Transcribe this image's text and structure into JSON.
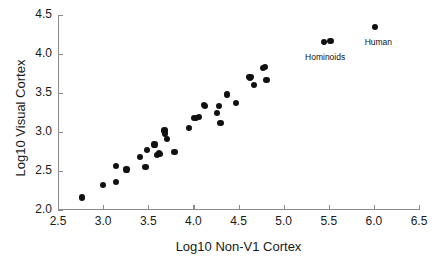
{
  "chart_data": {
    "type": "scatter",
    "title": "",
    "xlabel": "Log10 Non-V1 Cortex",
    "ylabel": "Log10 Visual Cortex",
    "xlim": [
      2.5,
      6.5
    ],
    "ylim": [
      2.0,
      4.5
    ],
    "xticks": [
      "2.5",
      "3.0",
      "3.5",
      "4.0",
      "4.5",
      "5.0",
      "5.5",
      "6.0",
      "6.5"
    ],
    "xtick_values": [
      2.5,
      3.0,
      3.5,
      4.0,
      4.5,
      5.0,
      5.5,
      6.0,
      6.5
    ],
    "yticks": [
      "2.0",
      "2.5",
      "3.0",
      "3.5",
      "4.0",
      "4.5"
    ],
    "ytick_values": [
      2.0,
      2.5,
      3.0,
      3.5,
      4.0,
      4.5
    ],
    "grid": false,
    "legend": null,
    "marker": "filled-circle",
    "marker_color": "#111111",
    "points": [
      {
        "x": 2.77,
        "y": 2.16
      },
      {
        "x": 3.0,
        "y": 2.32
      },
      {
        "x": 3.14,
        "y": 2.36
      },
      {
        "x": 3.14,
        "y": 2.56
      },
      {
        "x": 3.26,
        "y": 2.52
      },
      {
        "x": 3.41,
        "y": 2.68
      },
      {
        "x": 3.47,
        "y": 2.55
      },
      {
        "x": 3.49,
        "y": 2.77
      },
      {
        "x": 3.57,
        "y": 2.84
      },
      {
        "x": 3.6,
        "y": 2.7
      },
      {
        "x": 3.62,
        "y": 2.73
      },
      {
        "x": 3.63,
        "y": 2.72
      },
      {
        "x": 3.68,
        "y": 3.02
      },
      {
        "x": 3.69,
        "y": 2.98
      },
      {
        "x": 3.71,
        "y": 2.91
      },
      {
        "x": 3.79,
        "y": 2.74
      },
      {
        "x": 3.95,
        "y": 3.05
      },
      {
        "x": 4.01,
        "y": 3.18
      },
      {
        "x": 4.03,
        "y": 3.18
      },
      {
        "x": 4.06,
        "y": 3.19
      },
      {
        "x": 4.12,
        "y": 3.35
      },
      {
        "x": 4.13,
        "y": 3.33
      },
      {
        "x": 4.26,
        "y": 3.24
      },
      {
        "x": 4.28,
        "y": 3.33
      },
      {
        "x": 4.3,
        "y": 3.12
      },
      {
        "x": 4.37,
        "y": 3.48
      },
      {
        "x": 4.47,
        "y": 3.37
      },
      {
        "x": 4.62,
        "y": 3.7
      },
      {
        "x": 4.63,
        "y": 3.69
      },
      {
        "x": 4.64,
        "y": 3.71
      },
      {
        "x": 4.67,
        "y": 3.6
      },
      {
        "x": 4.77,
        "y": 3.82
      },
      {
        "x": 4.79,
        "y": 3.83
      },
      {
        "x": 4.81,
        "y": 3.67
      },
      {
        "x": 5.45,
        "y": 4.15
      },
      {
        "x": 5.52,
        "y": 4.17
      },
      {
        "x": 6.01,
        "y": 4.35
      }
    ],
    "annotations": [
      {
        "text": "Hominoids",
        "x": 5.46,
        "y": 4.03
      },
      {
        "text": "Human",
        "x": 6.05,
        "y": 4.22
      }
    ]
  }
}
